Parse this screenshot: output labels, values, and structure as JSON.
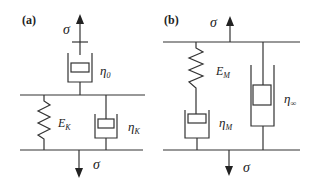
{
  "panels": [
    {
      "label": "(a)",
      "top_stress": "σ",
      "bottom_stress": "σ",
      "series_dashpot": {
        "symbol": "η",
        "subscript": "0"
      },
      "kelvin_spring": {
        "symbol": "E",
        "subscript": "K"
      },
      "kelvin_dashpot": {
        "symbol": "η",
        "subscript": "K"
      }
    },
    {
      "label": "(b)",
      "top_stress": "σ",
      "bottom_stress": "σ",
      "maxwell_spring": {
        "symbol": "E",
        "subscript": "M"
      },
      "maxwell_dashpot": {
        "symbol": "η",
        "subscript": "M"
      },
      "parallel_dashpot": {
        "symbol": "η",
        "subscript": "∞"
      }
    }
  ]
}
